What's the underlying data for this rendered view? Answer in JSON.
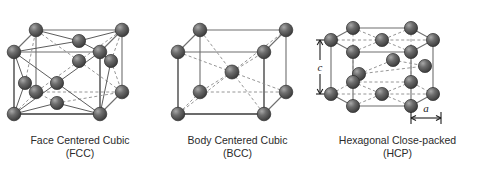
{
  "figure": {
    "background_color": "#ffffff",
    "atom_color": "#5a5a5a",
    "atom_highlight_color": "#9a9a9a",
    "edge_color": "#6e6e6e",
    "dashed_edge_color": "#8a8a8a",
    "caption_color": "#2b2b2b"
  },
  "panels": [
    {
      "id": "fcc",
      "diagram_name": "face-centered-cubic-diagram",
      "caption_line1": "Face Centered Cubic",
      "caption_line2": "(FCC)",
      "lattice_type": "cubic",
      "atom_count": 14,
      "corner_atoms": 8,
      "face_center_atoms": 6
    },
    {
      "id": "bcc",
      "diagram_name": "body-centered-cubic-diagram",
      "caption_line1": "Body Centered Cubic",
      "caption_line2": "(BCC)",
      "lattice_type": "cubic",
      "atom_count": 9,
      "corner_atoms": 8,
      "body_center_atoms": 1
    },
    {
      "id": "hcp",
      "diagram_name": "hexagonal-close-packed-diagram",
      "caption_line1": "Hexagonal Close-packed",
      "caption_line2": "(HCP)",
      "lattice_type": "hexagonal",
      "atom_count": 17,
      "dimensions": [
        {
          "label": "c",
          "orientation": "vertical",
          "describes": "prism-height"
        },
        {
          "label": "a",
          "orientation": "horizontal",
          "describes": "basal-edge-length"
        }
      ]
    }
  ]
}
